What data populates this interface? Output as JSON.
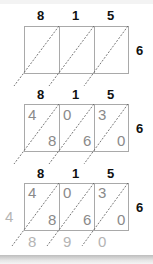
{
  "multiplicand_digits": [
    "8",
    "1",
    "5"
  ],
  "multiplier_digit": "6",
  "colors": {
    "grid_line": "#a9a9a9",
    "diagonal": "#555555",
    "header_text": "#111111",
    "cell_digit": "#8a8a8a",
    "result_digit": "#b4b4b4"
  },
  "steps": [
    {
      "name": "empty-lattice",
      "top": [
        "8",
        "1",
        "5"
      ],
      "right": "6",
      "cells": []
    },
    {
      "name": "filled-lattice",
      "top": [
        "8",
        "1",
        "5"
      ],
      "right": "6",
      "cells": [
        {
          "tens": "4",
          "ones": "8"
        },
        {
          "tens": "0",
          "ones": "6"
        },
        {
          "tens": "3",
          "ones": "0"
        }
      ]
    },
    {
      "name": "summed-lattice",
      "top": [
        "8",
        "1",
        "5"
      ],
      "right": "6",
      "cells": [
        {
          "tens": "4",
          "ones": "8"
        },
        {
          "tens": "0",
          "ones": "6"
        },
        {
          "tens": "3",
          "ones": "0"
        }
      ],
      "result_left": "4",
      "result_bottom": [
        "8",
        "9",
        "0"
      ]
    }
  ]
}
